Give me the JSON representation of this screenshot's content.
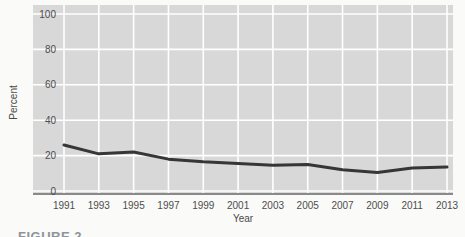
{
  "figure": {
    "caption": "FIGURE 2"
  },
  "chart_data": {
    "type": "line",
    "title": "",
    "x": [
      1991,
      1993,
      1995,
      1997,
      1999,
      2001,
      2003,
      2005,
      2007,
      2009,
      2011,
      2013
    ],
    "values": [
      26,
      21,
      22,
      18,
      16.5,
      15.5,
      14.5,
      15,
      12,
      10.5,
      13,
      13.5
    ],
    "xlabel": "Year",
    "ylabel": "Percent",
    "ylim": [
      0,
      100
    ],
    "yticks": [
      0,
      20,
      40,
      60,
      80,
      100
    ],
    "grid": true,
    "legend": false,
    "colors": {
      "panel_bg": "#d8d8d8",
      "gridline": "#ffffff",
      "line": "#363636",
      "axis_line": "#8a8a8a",
      "tick_text": "#4d4d4d"
    }
  }
}
